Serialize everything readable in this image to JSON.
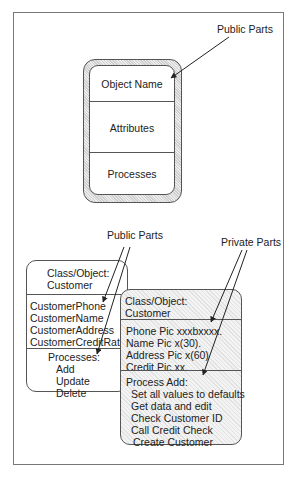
{
  "diagram": {
    "top": {
      "callout": "Public Parts",
      "object_box": {
        "sections": [
          "Object Name",
          "Attributes",
          "Processes"
        ]
      }
    },
    "bottom": {
      "public_callout": "Public Parts",
      "private_callout": "Private Parts",
      "public_box": {
        "header": [
          "Class/Object:",
          "Customer"
        ],
        "attributes": [
          "CustomerPhone",
          "CustomerName",
          "CustomerAddress",
          "CustomerCreditRating"
        ],
        "processes_title": "Processes:",
        "processes": [
          "Add",
          "Update",
          "Delete"
        ]
      },
      "private_box": {
        "header": [
          "Class/Object:",
          "Customer"
        ],
        "attributes": [
          "Phone Pic xxxbxxxx.",
          "Name Pic x(30).",
          "Address Pic x(60)",
          "Credit Pic xx."
        ],
        "process_title": "Process Add:",
        "process_steps": [
          "Set all values to defaults",
          "Get data and edit",
          "Check Customer ID",
          "Call Credit Check",
          "Create Customer"
        ]
      }
    }
  }
}
